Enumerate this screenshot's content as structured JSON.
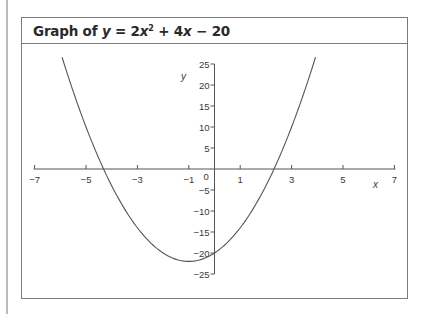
{
  "figure": {
    "title_prefix": "Graph of ",
    "title_var_y": "y",
    "title_eq": " = 2",
    "title_var_x": "x",
    "title_exp": "2",
    "title_rest": " + 4",
    "title_var_x2": "x",
    "title_tail": " − 20"
  },
  "chart_data": {
    "type": "line",
    "function": "y = 2x^2 + 4x - 20",
    "xlabel": "x",
    "ylabel": "y",
    "xlim": [
      -7,
      7
    ],
    "ylim": [
      -25,
      25
    ],
    "x_ticks": [
      -7,
      -5,
      -3,
      -1,
      0,
      1,
      3,
      5,
      7
    ],
    "x_tick_labels": [
      "−7",
      "−5",
      "−3",
      "−1",
      "0",
      "1",
      "3",
      "5",
      "7"
    ],
    "y_ticks": [
      25,
      20,
      15,
      10,
      5,
      -5,
      -10,
      -15,
      -20,
      -25
    ],
    "y_tick_labels": [
      "25",
      "20",
      "15",
      "10",
      "5",
      "−5",
      "−10",
      "−15",
      "−20",
      "−25"
    ],
    "grid": false,
    "legend": null,
    "series": [
      {
        "name": "y = 2x² + 4x − 20",
        "x": [
          -5.93,
          -5.5,
          -5,
          -4.5,
          -4,
          -3.5,
          -3,
          -2.5,
          -2,
          -1.5,
          -1,
          -0.5,
          0,
          0.5,
          1,
          1.5,
          2,
          2.5,
          3,
          3.5,
          3.93
        ],
        "y": [
          25.0,
          18.5,
          10,
          2.5,
          -4,
          -9.5,
          -14,
          -17.5,
          -20,
          -21.5,
          -22,
          -21.5,
          -20,
          -17.5,
          -14,
          -9.5,
          -4,
          2.5,
          10,
          18.5,
          25.0
        ]
      }
    ],
    "key_points": {
      "vertex": [
        -1,
        -22
      ],
      "y_intercept": [
        0,
        -20
      ],
      "x_intercepts": [
        -4.32,
        2.32
      ]
    }
  }
}
